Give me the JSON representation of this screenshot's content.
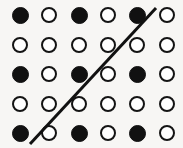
{
  "figure": {
    "width": 183,
    "height": 148,
    "background_color": "#f7f6f4"
  },
  "chart_data": {
    "type": "scatter",
    "subtitle": "",
    "xlabel": "",
    "ylabel": "",
    "grid": false,
    "legend_position": "none",
    "columns": 6,
    "rows": 5,
    "xlim": [
      0,
      183
    ],
    "ylim": [
      0,
      148
    ],
    "column_centers_px": [
      20,
      49,
      79,
      108,
      137,
      167
    ],
    "row_centers_px": [
      15,
      45,
      74,
      104,
      133
    ],
    "marker_styles": {
      "filled": {
        "name": "filled-dot",
        "fill_color": "#111111",
        "edge_color": "#111111",
        "diameter_px": 17
      },
      "open": {
        "name": "open-dot",
        "fill_color": "#ffffff",
        "edge_color": "#141414",
        "edge_width_px": 2,
        "diameter_px": 16
      }
    },
    "row_labels": [
      "row-1",
      "row-2",
      "row-3",
      "row-4",
      "row-5"
    ],
    "column_labels": [
      "col-1",
      "col-2",
      "col-3",
      "col-4",
      "col-5",
      "col-6"
    ],
    "grid_pattern": [
      [
        "filled",
        "open",
        "filled",
        "open",
        "filled",
        "open"
      ],
      [
        "open",
        "open",
        "open",
        "open",
        "open",
        "open"
      ],
      [
        "filled",
        "open",
        "filled",
        "open",
        "filled",
        "open"
      ],
      [
        "open",
        "open",
        "open",
        "open",
        "open",
        "open"
      ],
      [
        "filled",
        "open",
        "filled",
        "open",
        "filled",
        "open"
      ]
    ],
    "points": [
      {
        "col": 1,
        "row": 1,
        "x": 20,
        "y": 15,
        "style": "filled"
      },
      {
        "col": 2,
        "row": 1,
        "x": 49,
        "y": 15,
        "style": "open"
      },
      {
        "col": 3,
        "row": 1,
        "x": 79,
        "y": 15,
        "style": "filled"
      },
      {
        "col": 4,
        "row": 1,
        "x": 108,
        "y": 15,
        "style": "open"
      },
      {
        "col": 5,
        "row": 1,
        "x": 137,
        "y": 15,
        "style": "filled"
      },
      {
        "col": 6,
        "row": 1,
        "x": 167,
        "y": 15,
        "style": "open"
      },
      {
        "col": 1,
        "row": 2,
        "x": 20,
        "y": 45,
        "style": "open"
      },
      {
        "col": 2,
        "row": 2,
        "x": 49,
        "y": 45,
        "style": "open"
      },
      {
        "col": 3,
        "row": 2,
        "x": 79,
        "y": 45,
        "style": "open"
      },
      {
        "col": 4,
        "row": 2,
        "x": 108,
        "y": 45,
        "style": "open"
      },
      {
        "col": 5,
        "row": 2,
        "x": 137,
        "y": 45,
        "style": "open"
      },
      {
        "col": 6,
        "row": 2,
        "x": 167,
        "y": 45,
        "style": "open"
      },
      {
        "col": 1,
        "row": 3,
        "x": 20,
        "y": 74,
        "style": "filled"
      },
      {
        "col": 2,
        "row": 3,
        "x": 49,
        "y": 74,
        "style": "open"
      },
      {
        "col": 3,
        "row": 3,
        "x": 79,
        "y": 74,
        "style": "filled"
      },
      {
        "col": 4,
        "row": 3,
        "x": 108,
        "y": 74,
        "style": "open"
      },
      {
        "col": 5,
        "row": 3,
        "x": 137,
        "y": 74,
        "style": "filled"
      },
      {
        "col": 6,
        "row": 3,
        "x": 167,
        "y": 74,
        "style": "open"
      },
      {
        "col": 1,
        "row": 4,
        "x": 20,
        "y": 104,
        "style": "open"
      },
      {
        "col": 2,
        "row": 4,
        "x": 49,
        "y": 104,
        "style": "open"
      },
      {
        "col": 3,
        "row": 4,
        "x": 79,
        "y": 104,
        "style": "open"
      },
      {
        "col": 4,
        "row": 4,
        "x": 108,
        "y": 104,
        "style": "open"
      },
      {
        "col": 5,
        "row": 4,
        "x": 137,
        "y": 104,
        "style": "open"
      },
      {
        "col": 6,
        "row": 4,
        "x": 167,
        "y": 104,
        "style": "open"
      },
      {
        "col": 1,
        "row": 5,
        "x": 20,
        "y": 133,
        "style": "filled"
      },
      {
        "col": 2,
        "row": 5,
        "x": 49,
        "y": 133,
        "style": "open"
      },
      {
        "col": 3,
        "row": 5,
        "x": 79,
        "y": 133,
        "style": "filled"
      },
      {
        "col": 4,
        "row": 5,
        "x": 108,
        "y": 133,
        "style": "open"
      },
      {
        "col": 5,
        "row": 5,
        "x": 137,
        "y": 133,
        "style": "filled"
      },
      {
        "col": 6,
        "row": 5,
        "x": 167,
        "y": 133,
        "style": "open"
      }
    ],
    "annotations": [
      {
        "name": "diagonal-line",
        "type": "line",
        "x1": 30,
        "y1": 144,
        "x2": 156,
        "y2": 8,
        "color": "#111111",
        "width_px": 3
      }
    ]
  }
}
